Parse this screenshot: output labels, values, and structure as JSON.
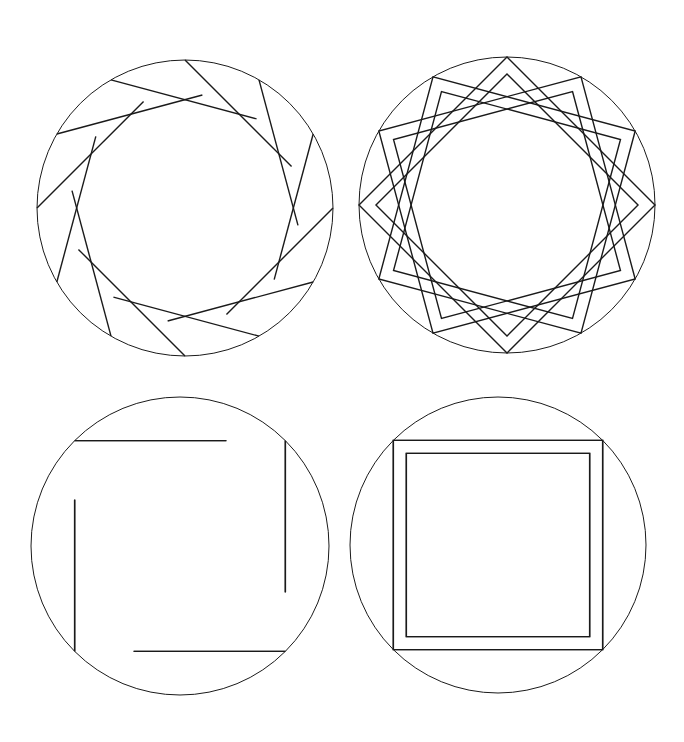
{
  "canvas": {
    "width": 684,
    "height": 742,
    "background": "#ffffff",
    "stroke": "#1a1a1a"
  },
  "figures": [
    {
      "id": "twelve-point-open",
      "cx": 185,
      "cy": 208,
      "r": 148,
      "style": "open-lines",
      "points": 12,
      "rotation": 0,
      "segments": "three squares rotated by 30 degrees with broken overlaps"
    },
    {
      "id": "twelve-point-interlaced",
      "cx": 507,
      "cy": 205,
      "r": 148,
      "style": "interlaced-band",
      "points": 12,
      "rotation": 0,
      "band": 12
    },
    {
      "id": "eight-point-open",
      "cx": 180,
      "cy": 546,
      "r": 149,
      "style": "open-lines",
      "points": 8,
      "rotation": 0,
      "segments": "two squares rotated by 45 degrees with broken overlaps"
    },
    {
      "id": "eight-point-interlaced",
      "cx": 498,
      "cy": 545,
      "r": 148,
      "style": "interlaced-band",
      "points": 8,
      "rotation": 0,
      "band": 13
    }
  ]
}
